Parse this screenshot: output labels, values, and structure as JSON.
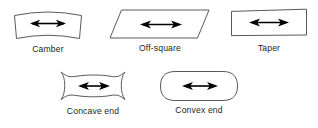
{
  "diagram": {
    "background_color": "#ffffff",
    "outline_color": "#58595b",
    "arrow_color": "#000000",
    "text_color": "#231f20",
    "figures": [
      {
        "id": "camber",
        "label": "Camber",
        "shape": "rectangle-with-bowed-top-and-bottom-edges",
        "arrow": "double-headed-horizontal-arrow"
      },
      {
        "id": "off-square",
        "label": "Off-square",
        "shape": "parallelogram",
        "arrow": "double-headed-horizontal-arrow"
      },
      {
        "id": "taper",
        "label": "Taper",
        "shape": "slightly-tapered-quadrilateral",
        "arrow": "double-headed-horizontal-arrow"
      },
      {
        "id": "concave-end",
        "label": "Concave end",
        "shape": "rectangle-with-concave-left-and-right-ends",
        "arrow": "double-headed-horizontal-arrow"
      },
      {
        "id": "convex-end",
        "label": "Convex end",
        "shape": "stadium-rounded-rectangle-with-convex-ends",
        "arrow": "double-headed-horizontal-arrow"
      }
    ]
  }
}
